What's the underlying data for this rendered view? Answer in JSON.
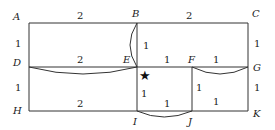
{
  "diagram": {
    "type": "grid-path-map",
    "points": {
      "A": {
        "label": "A",
        "x": 29,
        "y": 23
      },
      "B": {
        "label": "B",
        "x": 137,
        "y": 23
      },
      "C": {
        "label": "C",
        "x": 248,
        "y": 23
      },
      "D": {
        "label": "D",
        "x": 29,
        "y": 67
      },
      "E": {
        "label": "E",
        "x": 137,
        "y": 67
      },
      "F": {
        "label": "F",
        "x": 192,
        "y": 67
      },
      "G": {
        "label": "G",
        "x": 248,
        "y": 67
      },
      "H": {
        "label": "H",
        "x": 29,
        "y": 111
      },
      "I": {
        "label": "I",
        "x": 137,
        "y": 111
      },
      "J": {
        "label": "J",
        "x": 192,
        "y": 111
      },
      "K": {
        "label": "K",
        "x": 248,
        "y": 111
      }
    },
    "edge_labels": {
      "AB": "2",
      "BC": "2",
      "AD": "1",
      "CG": "1",
      "DE": "2",
      "BE": "1",
      "EF": "1",
      "FG": "1",
      "DH": "1",
      "GK": "1",
      "HI": "2",
      "EI": "1",
      "IJ": "1",
      "FJ": "1",
      "JK": "1"
    },
    "arcs": [
      "B-E",
      "D-E",
      "F-G",
      "I-J"
    ],
    "marker": {
      "symbol": "★",
      "name": "star",
      "near": "E"
    }
  }
}
